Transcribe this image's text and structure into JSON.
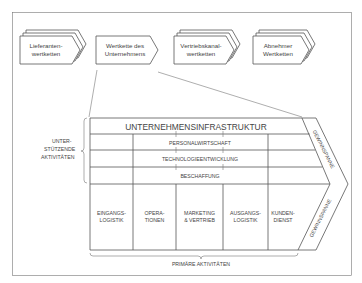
{
  "value_system": {
    "chains": [
      {
        "line1": "Lieferanten-",
        "line2": "wertketten",
        "stacked": true
      },
      {
        "line1": "Wertkette des",
        "line2": "Unternehmens",
        "stacked": false
      },
      {
        "line1": "Vertriebskanal-",
        "line2": "wertketten",
        "stacked": true
      },
      {
        "line1": "Abnehmer",
        "line2": "Wertketten",
        "stacked": true
      }
    ]
  },
  "value_chain": {
    "support_label": {
      "line1": "UNTER-",
      "line2": "STÜTZENDE",
      "line3": "AKTIVITÄTEN"
    },
    "support_activities": [
      "UNTERNEHMENSINFRASTRUKTUR",
      "PERSONALWIRTSCHAFT",
      "TECHNOLOGIEENTWICKLUNG",
      "BESCHAFFUNG"
    ],
    "primary_activities": [
      {
        "line1": "EINGANGS-",
        "line2": "LOGISTIK"
      },
      {
        "line1": "OPERA-",
        "line2": "TIONEN"
      },
      {
        "line1": "MARKETING",
        "line2": "& VERTRIEB"
      },
      {
        "line1": "AUSGANGS-",
        "line2": "LOGISTIK"
      },
      {
        "line1": "KUNDEN-",
        "line2": "DIENST"
      }
    ],
    "primary_label": "PRIMÄRE AKTIVITÄTEN",
    "margin_label_top": "GEWINNSPANNE",
    "margin_label_bottom": "GEWINNSPANNE"
  }
}
